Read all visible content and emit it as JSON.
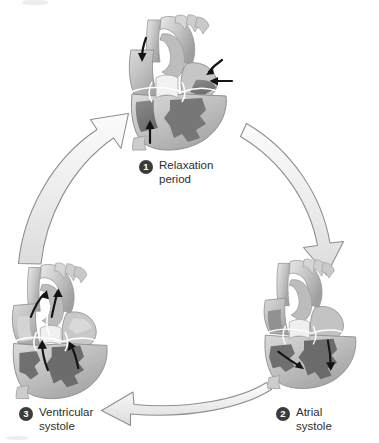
{
  "figure": {
    "background_color": "#ffffff",
    "arrow_fill": "#ececec",
    "arrow_stroke": "#8c8c8c",
    "badge_color": "#3b3b3b",
    "text_color": "#2e2e2e"
  },
  "stages": [
    {
      "number": "1",
      "label_line1": "Relaxation",
      "label_line2": "period",
      "image_name": "heart-relaxation-period",
      "position": "top-center"
    },
    {
      "number": "2",
      "label_line1": "Atrial",
      "label_line2": "systole",
      "image_name": "heart-atrial-systole",
      "position": "bottom-right"
    },
    {
      "number": "3",
      "label_line1": "Ventricular",
      "label_line2": "systole",
      "image_name": "heart-ventricular-systole",
      "position": "bottom-left"
    }
  ],
  "flow_arrows": [
    {
      "name": "arrow-relaxation-to-atrial",
      "direction": "clockwise-right-descending"
    },
    {
      "name": "arrow-atrial-to-ventricular",
      "direction": "leftward-along-bottom"
    },
    {
      "name": "arrow-ventricular-to-relaxation",
      "direction": "upward-right-ascending"
    }
  ],
  "heart_palette": {
    "myocardium_light": "#c9c9c9",
    "myocardium_mid": "#a8a8a8",
    "chamber_dark": "#7d7d7d",
    "chamber_darker": "#6a6a6a",
    "vessel_light": "#d7d7d7",
    "vessel_highlight": "#efefef",
    "valve_white": "#f3f3f3",
    "outline": "#8a8a8a",
    "blood_flow_arrow": "#141414"
  }
}
